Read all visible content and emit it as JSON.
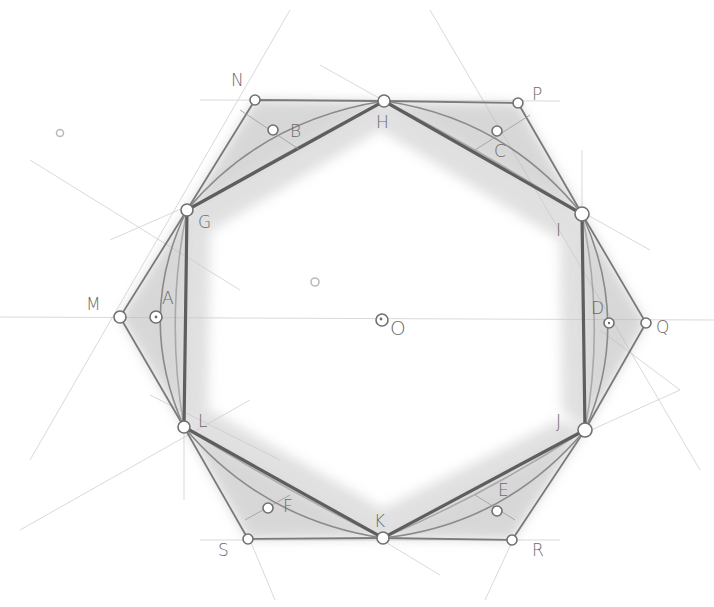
{
  "style": {
    "paper": "#ffffff",
    "pencil_dark": "#5e5e5e",
    "pencil_mid": "#8a8a8a",
    "pencil_light": "#cfcfcf",
    "shading": "#b8b8b8"
  },
  "center": {
    "label": "O",
    "x": 382,
    "y": 320
  },
  "hexagon": {
    "vertices": [
      {
        "label": "H",
        "x": 384,
        "y": 101
      },
      {
        "label": "I",
        "x": 582,
        "y": 214
      },
      {
        "label": "J",
        "x": 585,
        "y": 430
      },
      {
        "label": "K",
        "x": 383,
        "y": 538
      },
      {
        "label": "L",
        "x": 184,
        "y": 427
      },
      {
        "label": "G",
        "x": 187,
        "y": 210
      }
    ]
  },
  "outer_points": [
    {
      "label": "N",
      "x": 255,
      "y": 100
    },
    {
      "label": "P",
      "x": 518,
      "y": 103
    },
    {
      "label": "Q",
      "x": 646,
      "y": 323
    },
    {
      "label": "R",
      "x": 512,
      "y": 540
    },
    {
      "label": "S",
      "x": 248,
      "y": 539
    },
    {
      "label": "M",
      "x": 120,
      "y": 317
    }
  ],
  "arc_midpoints": [
    {
      "label": "B",
      "x": 273,
      "y": 130
    },
    {
      "label": "C",
      "x": 497,
      "y": 131
    },
    {
      "label": "D",
      "x": 609,
      "y": 323
    },
    {
      "label": "E",
      "x": 497,
      "y": 511
    },
    {
      "label": "F",
      "x": 268,
      "y": 508
    },
    {
      "label": "A",
      "x": 156,
      "y": 317
    }
  ],
  "stray_marks": [
    {
      "label": "",
      "x": 60,
      "y": 133
    },
    {
      "label": "",
      "x": 315,
      "y": 282
    }
  ],
  "labels": {
    "N": "N",
    "P": "P",
    "Q": "Q",
    "R": "R",
    "S": "S",
    "M": "M",
    "H": "H",
    "I": "I",
    "J": "J",
    "K": "K",
    "L": "L",
    "G": "G",
    "A": "A",
    "B": "B",
    "C": "C",
    "D": "D",
    "E": "E",
    "F": "F",
    "O": "O"
  }
}
